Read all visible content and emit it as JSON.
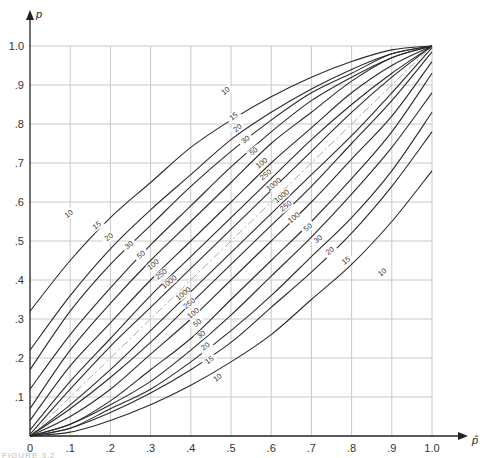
{
  "chart_data": {
    "type": "line",
    "title": "",
    "xlabel": "p̂",
    "ylabel": "p",
    "xlim": [
      0,
      1.0
    ],
    "ylim": [
      0,
      1.0
    ],
    "grid": true,
    "x_ticks": [
      "0",
      ".1",
      ".2",
      ".3",
      ".4",
      ".5",
      ".6",
      ".7",
      ".8",
      ".9",
      "1.0"
    ],
    "y_ticks": [
      ".1",
      ".2",
      ".3",
      ".4",
      ".5",
      ".6",
      ".7",
      ".8",
      ".9",
      "1.0"
    ],
    "x": [
      0,
      0.1,
      0.2,
      0.3,
      0.4,
      0.5,
      0.6,
      0.7,
      0.8,
      0.9,
      1.0
    ],
    "reference_line": {
      "name": "p = p̂",
      "style": "dash-dot",
      "color": "#aaaaaa"
    },
    "series": [
      {
        "name": "10",
        "upper": [
          0.32,
          0.45,
          0.56,
          0.65,
          0.74,
          0.81,
          0.87,
          0.92,
          0.96,
          0.99,
          1.0
        ]
      },
      {
        "name": "15",
        "upper": [
          0.22,
          0.36,
          0.48,
          0.58,
          0.67,
          0.76,
          0.83,
          0.89,
          0.94,
          0.98,
          1.0
        ]
      },
      {
        "name": "20",
        "upper": [
          0.17,
          0.32,
          0.44,
          0.54,
          0.64,
          0.73,
          0.81,
          0.88,
          0.93,
          0.98,
          1.0
        ]
      },
      {
        "name": "30",
        "upper": [
          0.12,
          0.26,
          0.38,
          0.49,
          0.59,
          0.69,
          0.78,
          0.86,
          0.92,
          0.97,
          1.0
        ]
      },
      {
        "name": "50",
        "upper": [
          0.07,
          0.22,
          0.34,
          0.45,
          0.55,
          0.65,
          0.75,
          0.83,
          0.91,
          0.97,
          1.0
        ]
      },
      {
        "name": "100",
        "upper": [
          0.04,
          0.18,
          0.29,
          0.4,
          0.5,
          0.6,
          0.7,
          0.79,
          0.88,
          0.95,
          1.0
        ]
      },
      {
        "name": "250",
        "upper": [
          0.015,
          0.14,
          0.25,
          0.36,
          0.46,
          0.56,
          0.66,
          0.76,
          0.85,
          0.93,
          1.0
        ]
      },
      {
        "name": "1000",
        "upper": [
          0.004,
          0.12,
          0.23,
          0.33,
          0.43,
          0.53,
          0.63,
          0.73,
          0.83,
          0.92,
          1.0
        ]
      }
    ],
    "lower_bound_rule": "lower(p̂) = 1 - upper(1 - p̂)",
    "upper_labels": [
      {
        "text": "10",
        "x": 0.1,
        "y": 0.565
      },
      {
        "text": "15",
        "x": 0.17,
        "y": 0.535
      },
      {
        "text": "20",
        "x": 0.2,
        "y": 0.505
      },
      {
        "text": "30",
        "x": 0.25,
        "y": 0.485
      },
      {
        "text": "50",
        "x": 0.28,
        "y": 0.46
      },
      {
        "text": "100",
        "x": 0.31,
        "y": 0.435
      },
      {
        "text": "250",
        "x": 0.33,
        "y": 0.41
      },
      {
        "text": "1000",
        "x": 0.35,
        "y": 0.39
      },
      {
        "text": "10",
        "x": 0.49,
        "y": 0.88
      },
      {
        "text": "15",
        "x": 0.51,
        "y": 0.815
      },
      {
        "text": "20",
        "x": 0.52,
        "y": 0.785
      },
      {
        "text": "30",
        "x": 0.54,
        "y": 0.755
      },
      {
        "text": "50",
        "x": 0.56,
        "y": 0.725
      },
      {
        "text": "100",
        "x": 0.58,
        "y": 0.695
      },
      {
        "text": "250",
        "x": 0.59,
        "y": 0.665
      },
      {
        "text": "1000",
        "x": 0.61,
        "y": 0.64
      }
    ],
    "lower_labels": [
      {
        "text": "1000",
        "x": 0.385,
        "y": 0.36
      },
      {
        "text": "250",
        "x": 0.4,
        "y": 0.335
      },
      {
        "text": "100",
        "x": 0.41,
        "y": 0.31
      },
      {
        "text": "50",
        "x": 0.42,
        "y": 0.285
      },
      {
        "text": "30",
        "x": 0.43,
        "y": 0.255
      },
      {
        "text": "20",
        "x": 0.44,
        "y": 0.225
      },
      {
        "text": "15",
        "x": 0.45,
        "y": 0.19
      },
      {
        "text": "10",
        "x": 0.47,
        "y": 0.145
      },
      {
        "text": "1000",
        "x": 0.63,
        "y": 0.61
      },
      {
        "text": "250",
        "x": 0.64,
        "y": 0.585
      },
      {
        "text": "100",
        "x": 0.66,
        "y": 0.555
      },
      {
        "text": "50",
        "x": 0.695,
        "y": 0.53
      },
      {
        "text": "30",
        "x": 0.72,
        "y": 0.5
      },
      {
        "text": "20",
        "x": 0.75,
        "y": 0.47
      },
      {
        "text": "15",
        "x": 0.79,
        "y": 0.445
      },
      {
        "text": "10",
        "x": 0.88,
        "y": 0.415
      }
    ]
  },
  "axes": {
    "x_label": "p̂",
    "y_label": "p",
    "origin_label": "0"
  },
  "caption": "FIGURE 3.2"
}
